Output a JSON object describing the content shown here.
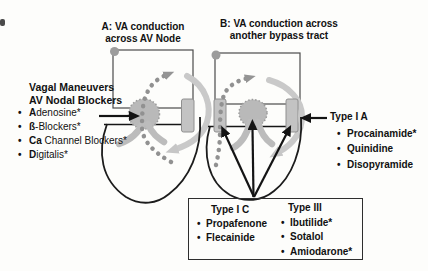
{
  "figure": {
    "panel_a_title": [
      "A: VA conduction",
      "across AV Node"
    ],
    "panel_b_title": [
      "B: VA conduction across",
      "another bypass tract"
    ]
  },
  "left_panel": {
    "heading": [
      "Vagal Maneuvers",
      "AV Nodal Blockers"
    ],
    "items": [
      {
        "lead": "A",
        "rest": "denosine*"
      },
      {
        "lead": "ß",
        "rest": "-Blockers*"
      },
      {
        "lead": "Ca",
        "rest": " Channel Blockers*"
      },
      {
        "lead": "D",
        "rest": "igitalis*"
      }
    ]
  },
  "type_ia": {
    "heading": "Type I A",
    "items": [
      "Procainamide*",
      "Quinidine",
      "Disopyramide"
    ]
  },
  "bottom_box": {
    "columns": [
      {
        "heading": "Type I C",
        "items": [
          "Propafenone",
          "Flecainide"
        ]
      },
      {
        "heading": "Type III",
        "items": [
          "Ibutilide*",
          "Sotalol",
          "Amiodarone*"
        ]
      }
    ]
  },
  "bullet_glyph": "•",
  "colors": {
    "text": "#111111",
    "heart_outline": "#1c1c1c",
    "atria_outline": "#4b4b4b",
    "conduction_gray": "#bcbcbc",
    "dotted_arrow_gray": "#919191",
    "arc_arrow_gray": "#c9c9c9",
    "arrow_black": "#141414"
  }
}
